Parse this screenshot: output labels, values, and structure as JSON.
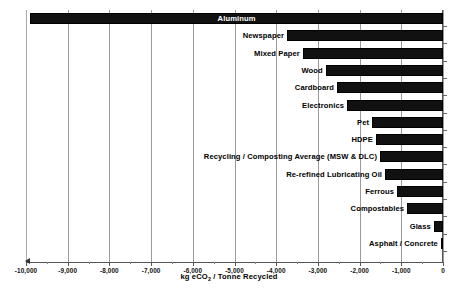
{
  "chart_data": {
    "type": "bar",
    "orientation": "horizontal",
    "title": "",
    "xlabel": "kg eCO2 / Tonne Recycled",
    "xlabel_parts": {
      "pre": "kg eCO",
      "sub": "2",
      "post": " / Tonne Recycled"
    },
    "ylabel": "",
    "xlim": [
      -10000,
      0
    ],
    "xticks": [
      -10000,
      -9000,
      -8000,
      -7000,
      -6000,
      -5000,
      -4000,
      -3000,
      -2000,
      -1000,
      0
    ],
    "xtick_labels": [
      "-10,000",
      "-9,000",
      "-8,000",
      "-7,000",
      "-6,000",
      "-5,000",
      "-4,000",
      "-3,000",
      "-2,000",
      "-1,000",
      "0"
    ],
    "grid": true,
    "legend": false,
    "bar_color": "#111111",
    "categories": [
      "Aluminum",
      "Newspaper",
      "Mixed Paper",
      "Wood",
      "Cardboard",
      "Electronics",
      "Pet",
      "HDPE",
      "Recycling / Composting Average (MSW & DLC)",
      "Re-refined Lubricating Oil",
      "Ferrous",
      "Compostables",
      "Glass",
      "Asphalt / Concrete"
    ],
    "values": [
      -9900,
      -3740,
      -3360,
      -2810,
      -2540,
      -2300,
      -1700,
      -1610,
      -1510,
      -1390,
      -1100,
      -860,
      -220,
      -50
    ],
    "label_placement": [
      "inside",
      "outside",
      "outside",
      "outside",
      "outside",
      "outside",
      "outside",
      "outside",
      "outside",
      "outside",
      "outside",
      "outside",
      "outside",
      "outside"
    ]
  }
}
